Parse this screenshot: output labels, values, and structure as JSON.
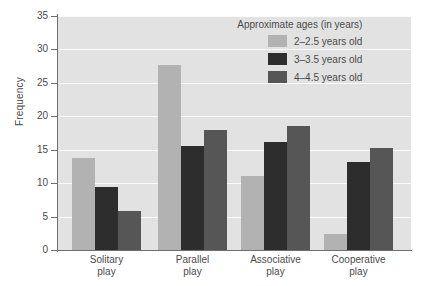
{
  "chart_data": {
    "type": "bar",
    "title": "",
    "xlabel": "",
    "ylabel": "Frequency",
    "ylim": [
      0,
      35
    ],
    "ytick_step": 5,
    "yticks": [
      "0",
      "5",
      "10",
      "15",
      "20",
      "25",
      "30",
      "35"
    ],
    "grid": true,
    "legend_position": "top-right",
    "legend_title": "Approximate ages (in years)",
    "categories": [
      {
        "line1": "Solitary",
        "line2": "play"
      },
      {
        "line1": "Parallel",
        "line2": "play"
      },
      {
        "line1": "Associative",
        "line2": "play"
      },
      {
        "line1": "Cooperative",
        "line2": "play"
      }
    ],
    "category_labels": [
      "Solitary play",
      "Parallel play",
      "Associative play",
      "Cooperative play"
    ],
    "series": [
      {
        "name": "2–2.5 years old",
        "color": "#b2b2b2",
        "values": [
          13.7,
          27.6,
          11.0,
          2.4
        ]
      },
      {
        "name": "3–3.5 years old",
        "color": "#2d2d2d",
        "values": [
          9.4,
          15.5,
          16.2,
          13.2
        ]
      },
      {
        "name": "4–4.5 years old",
        "color": "#565656",
        "values": [
          5.8,
          17.9,
          18.6,
          15.3
        ]
      }
    ]
  },
  "colors": {
    "plot_background": "#e2e2e2",
    "gridline": "#fbfbfb",
    "axis": "#6f6f6f",
    "text": "#4a4a4a",
    "page_background": "#ffffff"
  }
}
